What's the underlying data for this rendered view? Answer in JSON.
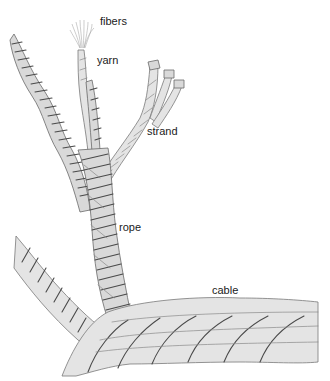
{
  "diagram": {
    "colors": {
      "background": "#ffffff",
      "rope_fill": "#d9d9d9",
      "rope_shadow": "#4a4a4a",
      "label_text": "#1a1a1a"
    },
    "labels": {
      "fibers": "fibers",
      "yarn": "yarn",
      "strand": "strand",
      "rope": "rope",
      "cable": "cable"
    }
  }
}
